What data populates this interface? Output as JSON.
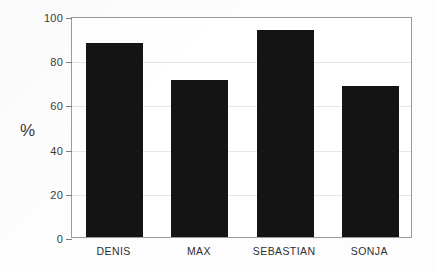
{
  "chart_data": {
    "type": "bar",
    "title": "",
    "subtitle": "",
    "xlabel": "",
    "ylabel": "%",
    "categories": [
      "DENIS",
      "MAX",
      "SEBASTIAN",
      "SONJA"
    ],
    "values": [
      88,
      71,
      93.5,
      68.5
    ],
    "ylim": [
      0,
      100
    ],
    "yticks": [
      0,
      20,
      40,
      60,
      80,
      100
    ],
    "ytick_labels": [
      "0",
      "20",
      "40",
      "60",
      "80",
      "100"
    ],
    "grid": true,
    "legend": null,
    "legend_position": "none",
    "bar_color": "#141414",
    "frame_color": "#9a9a9a",
    "grid_color": "#e6e6e6",
    "background_color": "#ffffff"
  }
}
